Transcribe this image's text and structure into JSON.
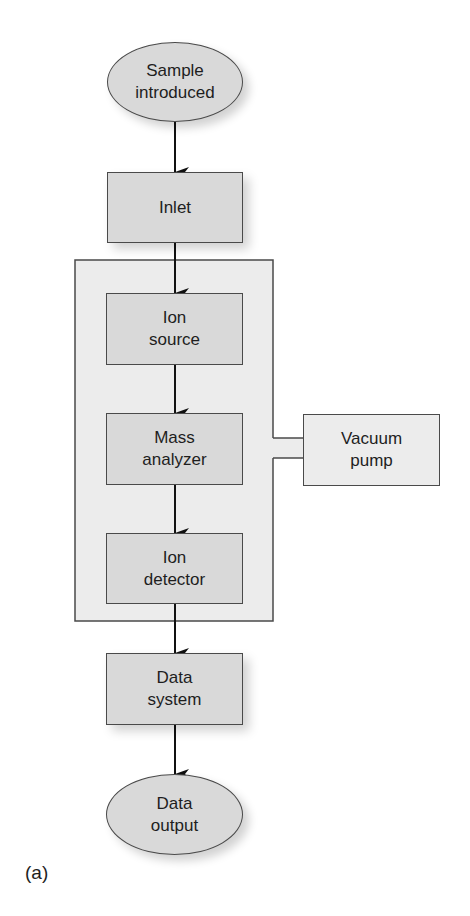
{
  "diagram": {
    "nodes": {
      "sample": "Sample\nintroduced",
      "inlet": "Inlet",
      "ion_source": "Ion\nsource",
      "mass_analyzer": "Mass\nanalyzer",
      "ion_detector": "Ion\ndetector",
      "vacuum_pump": "Vacuum\npump",
      "data_system": "Data\nsystem",
      "data_output": "Data\noutput"
    },
    "edges": [
      [
        "sample",
        "inlet"
      ],
      [
        "inlet",
        "ion_source"
      ],
      [
        "ion_source",
        "mass_analyzer"
      ],
      [
        "mass_analyzer",
        "ion_detector"
      ],
      [
        "ion_detector",
        "data_system"
      ],
      [
        "data_system",
        "data_output"
      ]
    ],
    "groups": [
      {
        "name": "vacuum-chamber",
        "members": [
          "ion_source",
          "mass_analyzer",
          "ion_detector"
        ],
        "connected_to": "vacuum_pump"
      }
    ],
    "panel_label": "(a)",
    "colors": {
      "node_fill": "#d9d9d9",
      "chamber_fill": "#ececec",
      "stroke": "#4a4a4a",
      "arrow": "#111111"
    }
  }
}
